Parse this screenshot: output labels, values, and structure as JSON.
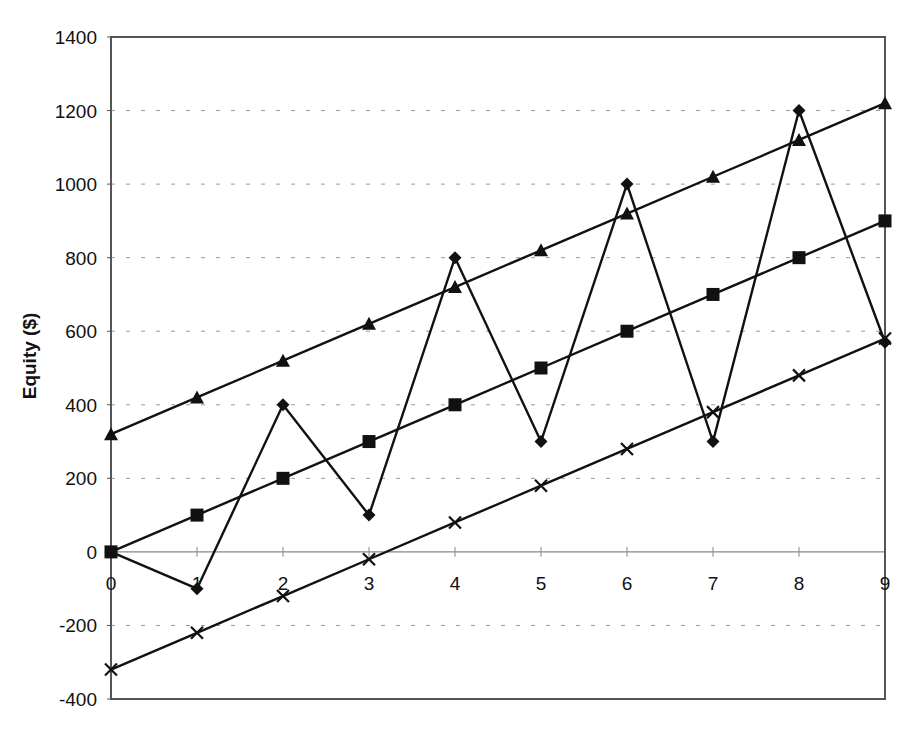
{
  "chart_data": {
    "type": "line",
    "title": "",
    "xlabel": "",
    "ylabel": "Equity ($)",
    "x": [
      0,
      1,
      2,
      3,
      4,
      5,
      6,
      7,
      8,
      9
    ],
    "xlim": [
      0,
      9
    ],
    "ylim": [
      -400,
      1400
    ],
    "yticks": [
      -400,
      -200,
      0,
      200,
      400,
      600,
      800,
      1000,
      1200,
      1400
    ],
    "xticks": [
      0,
      1,
      2,
      3,
      4,
      5,
      6,
      7,
      8,
      9
    ],
    "grid": {
      "horizontal": true,
      "style": "dashed"
    },
    "legend": null,
    "series": [
      {
        "name": "Triangle series",
        "marker": "triangle",
        "values": [
          320,
          420,
          520,
          620,
          720,
          820,
          920,
          1020,
          1120,
          1220
        ]
      },
      {
        "name": "Diamond series",
        "marker": "diamond",
        "values": [
          0,
          -100,
          400,
          100,
          800,
          300,
          1000,
          300,
          1200,
          570
        ]
      },
      {
        "name": "Square series",
        "marker": "square",
        "values": [
          0,
          100,
          200,
          300,
          400,
          500,
          600,
          700,
          800,
          900
        ]
      },
      {
        "name": "Cross series",
        "marker": "cross",
        "values": [
          -320,
          -220,
          -120,
          -20,
          80,
          180,
          280,
          380,
          480,
          580
        ]
      }
    ]
  },
  "colors": {
    "line": "#111111",
    "grid": "#9a9a9a",
    "frame": "#555555",
    "zero_axis": "#888888"
  }
}
